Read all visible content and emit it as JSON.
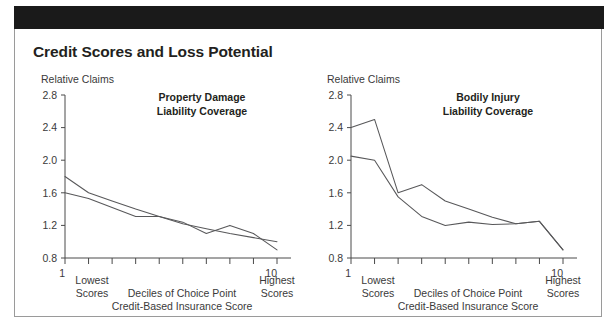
{
  "figure": {
    "title": "Credit Scores and Loss Potential",
    "background_color": "#ffffff",
    "header_bar_color": "#1a1a1a",
    "border_color": "#9a9a9a",
    "line_color": "#58585a"
  },
  "charts": [
    {
      "panel": "left",
      "ylabel": "Relative Claims",
      "subtitle_line1": "Property Damage",
      "subtitle_line2": "Liability Coverage",
      "x_low_label_line1": "1",
      "x_low_label_line2": "Lowest",
      "x_low_label_line3": "Scores",
      "x_high_label_line1": "10",
      "x_high_label_line2": "Highest",
      "x_high_label_line3": "Scores",
      "x_center_label_line1": "Deciles of Choice Point",
      "x_center_label_line2": "Credit-Based Insurance Score",
      "ytick_labels": [
        "2.8",
        "2.4",
        "2.0",
        "1.6",
        "1.2",
        "0.8"
      ]
    },
    {
      "panel": "right",
      "ylabel": "Relative Claims",
      "subtitle_line1": "Bodily Injury",
      "subtitle_line2": "Liability Coverage",
      "x_low_label_line1": "1",
      "x_low_label_line2": "Lowest",
      "x_low_label_line3": "Scores",
      "x_high_label_line1": "10",
      "x_high_label_line2": "Highest",
      "x_high_label_line3": "Scores",
      "x_center_label_line1": "Deciles of Choice Point",
      "x_center_label_line2": "Credit-Based Insurance Score",
      "ytick_labels": [
        "2.8",
        "2.4",
        "2.0",
        "1.6",
        "1.2",
        "0.8"
      ]
    }
  ],
  "chart_data": [
    {
      "type": "line",
      "title": "Property Damage Liability Coverage",
      "xlabel": "Deciles of Choice Point Credit-Based Insurance Score",
      "ylabel": "Relative Claims",
      "categories": [
        1,
        2,
        3,
        4,
        5,
        6,
        7,
        8,
        9,
        10
      ],
      "xlim": [
        1,
        10
      ],
      "ylim": [
        0.8,
        2.8
      ],
      "yticks": [
        0.8,
        1.2,
        1.6,
        2.0,
        2.4,
        2.8
      ],
      "grid": false,
      "legend": "none",
      "series": [
        {
          "name": "series-1",
          "values": [
            1.8,
            1.6,
            1.5,
            1.4,
            1.31,
            1.22,
            1.16,
            1.1,
            1.05,
            1.0
          ]
        },
        {
          "name": "series-2",
          "values": [
            1.6,
            1.53,
            1.42,
            1.31,
            1.31,
            1.24,
            1.1,
            1.2,
            1.1,
            0.9
          ]
        }
      ]
    },
    {
      "type": "line",
      "title": "Bodily Injury Liability Coverage",
      "xlabel": "Deciles of Choice Point Credit-Based Insurance Score",
      "ylabel": "Relative Claims",
      "categories": [
        1,
        2,
        3,
        4,
        5,
        6,
        7,
        8,
        9,
        10
      ],
      "xlim": [
        1,
        10
      ],
      "ylim": [
        0.8,
        2.8
      ],
      "yticks": [
        0.8,
        1.2,
        1.6,
        2.0,
        2.4,
        2.8
      ],
      "grid": false,
      "legend": "none",
      "series": [
        {
          "name": "series-1",
          "values": [
            2.4,
            2.5,
            1.6,
            1.7,
            1.5,
            1.4,
            1.3,
            1.22,
            1.25,
            0.9
          ]
        },
        {
          "name": "series-2",
          "values": [
            2.05,
            2.0,
            1.55,
            1.31,
            1.2,
            1.24,
            1.21,
            1.22,
            1.25,
            0.9
          ]
        }
      ]
    }
  ]
}
